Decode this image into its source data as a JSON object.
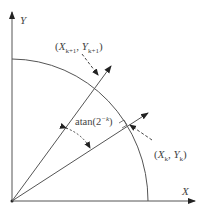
{
  "diagram": {
    "axes": {
      "x_label": "X",
      "y_label": "Y"
    },
    "points": {
      "current": {
        "label_open": "(",
        "x": "X",
        "x_sub": "k",
        "sep": ", ",
        "y": "Y",
        "y_sub": "k",
        "label_close": ")"
      },
      "next": {
        "label_open": "(",
        "x": "X",
        "x_sub": "k+1",
        "sep": ", ",
        "y": "Y",
        "y_sub": "k+1",
        "label_close": ")"
      }
    },
    "angle": {
      "func": "atan(2",
      "exponent": "−k",
      "close": ")"
    },
    "colors": {
      "line": "#555555",
      "text": "#444444",
      "background": "#ffffff"
    }
  }
}
